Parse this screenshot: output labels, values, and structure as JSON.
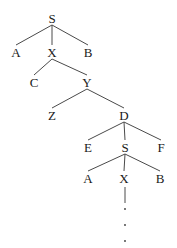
{
  "diagram": {
    "type": "tree",
    "nodes": [
      {
        "id": "n_S1",
        "label": "S",
        "x": 52,
        "y": 18
      },
      {
        "id": "n_A1",
        "label": "A",
        "x": 16,
        "y": 52
      },
      {
        "id": "n_X1",
        "label": "X",
        "x": 52,
        "y": 52
      },
      {
        "id": "n_B1",
        "label": "B",
        "x": 88,
        "y": 52
      },
      {
        "id": "n_C",
        "label": "C",
        "x": 34,
        "y": 82
      },
      {
        "id": "n_Y",
        "label": "Y",
        "x": 87,
        "y": 82
      },
      {
        "id": "n_Z",
        "label": "Z",
        "x": 52,
        "y": 115
      },
      {
        "id": "n_D",
        "label": "D",
        "x": 124,
        "y": 115
      },
      {
        "id": "n_E",
        "label": "E",
        "x": 88,
        "y": 147
      },
      {
        "id": "n_S2",
        "label": "S",
        "x": 125,
        "y": 147
      },
      {
        "id": "n_F",
        "label": "F",
        "x": 161,
        "y": 147
      },
      {
        "id": "n_A2",
        "label": "A",
        "x": 88,
        "y": 178
      },
      {
        "id": "n_X2",
        "label": "X",
        "x": 124,
        "y": 178
      },
      {
        "id": "n_B2",
        "label": "B",
        "x": 160,
        "y": 178
      }
    ],
    "edges": [
      {
        "from": "n_S1",
        "to": "n_A1"
      },
      {
        "from": "n_S1",
        "to": "n_X1"
      },
      {
        "from": "n_S1",
        "to": "n_B1"
      },
      {
        "from": "n_X1",
        "to": "n_C"
      },
      {
        "from": "n_X1",
        "to": "n_Y"
      },
      {
        "from": "n_Y",
        "to": "n_Z"
      },
      {
        "from": "n_Y",
        "to": "n_D"
      },
      {
        "from": "n_D",
        "to": "n_E"
      },
      {
        "from": "n_D",
        "to": "n_S2"
      },
      {
        "from": "n_D",
        "to": "n_F"
      },
      {
        "from": "n_S2",
        "to": "n_A2"
      },
      {
        "from": "n_S2",
        "to": "n_X2"
      },
      {
        "from": "n_S2",
        "to": "n_B2"
      }
    ],
    "continuation": {
      "from": "n_X2",
      "line": {
        "x": 125,
        "y1": 187,
        "y2": 203
      },
      "dots": [
        {
          "x": 125,
          "y": 209
        },
        {
          "x": 125,
          "y": 225
        },
        {
          "x": 125,
          "y": 241
        }
      ]
    }
  }
}
